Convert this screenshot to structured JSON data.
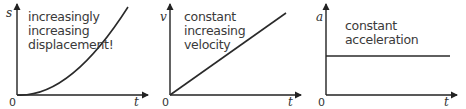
{
  "graphs": [
    {
      "id": "displacement-time",
      "y_label": "s",
      "x_label": "t",
      "origin": "0",
      "caption_lines": [
        "increasingly",
        "increasing",
        "displacement!"
      ],
      "curve": "parabola"
    },
    {
      "id": "velocity-time",
      "y_label": "v",
      "x_label": "t",
      "origin": "0",
      "caption_lines": [
        "constant",
        "increasing",
        "velocity"
      ],
      "curve": "straight-line-rising"
    },
    {
      "id": "acceleration-time",
      "y_label": "a",
      "x_label": "t",
      "origin": "0",
      "caption_lines": [
        "constant",
        "acceleration"
      ],
      "curve": "horizontal-line"
    }
  ],
  "colors": {
    "axis": "#222222",
    "curve": "#2a2a2a",
    "text": "#3a3a3a"
  }
}
